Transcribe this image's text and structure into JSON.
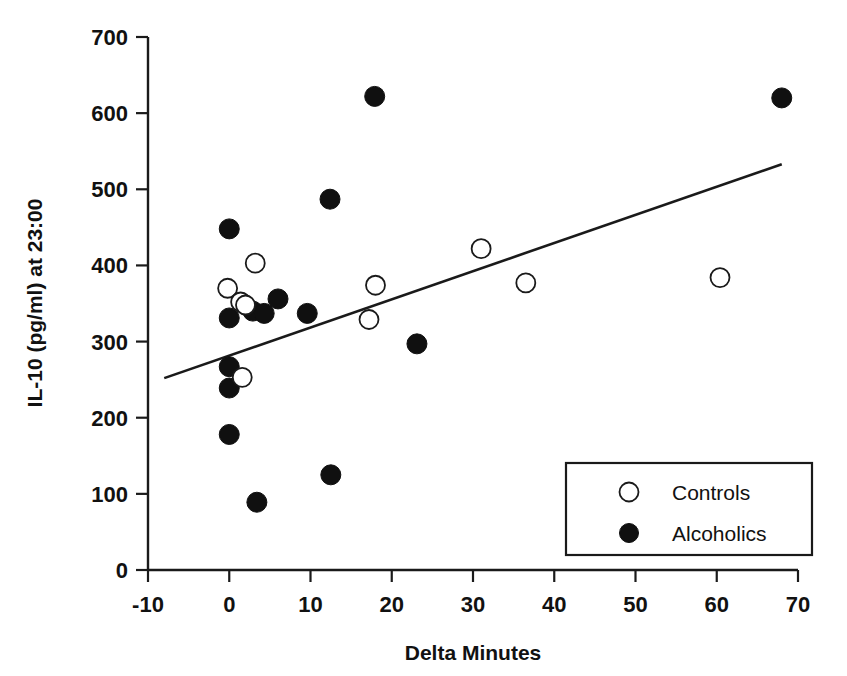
{
  "chart_data": {
    "type": "scatter",
    "title": "",
    "xlabel": "Delta Minutes",
    "ylabel": "IL-10 (pg/ml) at 23:00",
    "xlim": [
      -10,
      70
    ],
    "ylim": [
      0,
      700
    ],
    "xticks": [
      -10,
      0,
      10,
      20,
      30,
      40,
      50,
      60,
      70
    ],
    "yticks": [
      0,
      100,
      200,
      300,
      400,
      500,
      600,
      700
    ],
    "xtick_labels": [
      "-10",
      "0",
      "10",
      "20",
      "30",
      "40",
      "50",
      "60",
      "70"
    ],
    "ytick_labels": [
      "0",
      "100",
      "200",
      "300",
      "400",
      "500",
      "600",
      "700"
    ],
    "grid": false,
    "legend_position": "lower right",
    "series": [
      {
        "name": "Controls",
        "marker": "open-circle",
        "color": "#ffffff",
        "edge_color": "#1a1a1a",
        "points": [
          {
            "x": -0.2,
            "y": 370
          },
          {
            "x": 1.4,
            "y": 352
          },
          {
            "x": 2.0,
            "y": 348
          },
          {
            "x": 3.2,
            "y": 403
          },
          {
            "x": 1.6,
            "y": 253
          },
          {
            "x": 17.2,
            "y": 329
          },
          {
            "x": 18.0,
            "y": 374
          },
          {
            "x": 31.0,
            "y": 422
          },
          {
            "x": 36.5,
            "y": 377
          },
          {
            "x": 60.4,
            "y": 384
          }
        ]
      },
      {
        "name": "Alcoholics",
        "marker": "filled-circle",
        "color": "#101010",
        "edge_color": "#101010",
        "points": [
          {
            "x": 0.0,
            "y": 448
          },
          {
            "x": 0.0,
            "y": 331
          },
          {
            "x": 0.0,
            "y": 267
          },
          {
            "x": 0.0,
            "y": 239
          },
          {
            "x": 0.0,
            "y": 178
          },
          {
            "x": 2.9,
            "y": 340
          },
          {
            "x": 4.3,
            "y": 337
          },
          {
            "x": 3.4,
            "y": 89
          },
          {
            "x": 6.0,
            "y": 356
          },
          {
            "x": 9.6,
            "y": 337
          },
          {
            "x": 12.4,
            "y": 487
          },
          {
            "x": 12.5,
            "y": 125
          },
          {
            "x": 17.9,
            "y": 622
          },
          {
            "x": 23.1,
            "y": 297
          },
          {
            "x": 68.0,
            "y": 620
          }
        ]
      }
    ],
    "trend_line": {
      "name": "regression-line",
      "x_start": -8.0,
      "y_start": 252,
      "x_end": 68.0,
      "y_end": 533
    },
    "legend": [
      {
        "label": "Controls",
        "marker": "open-circle"
      },
      {
        "label": "Alcoholics",
        "marker": "filled-circle"
      }
    ]
  }
}
